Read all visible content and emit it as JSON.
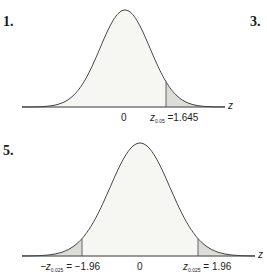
{
  "problems": [
    {
      "number": "1.",
      "x_label": "0",
      "cutoff_prefix": "z",
      "cutoff_sub": "0.05",
      "cutoff_value": "=1.645",
      "axis": "z"
    },
    {
      "number": "3."
    },
    {
      "number": "5.",
      "x_label": "0",
      "left_prefix": "−z",
      "left_sub": "0.025",
      "left_value": "= −1.96",
      "right_prefix": "z",
      "right_sub": "0.025",
      "right_value": "= 1.96",
      "axis": "z"
    }
  ],
  "chart_data": [
    {
      "type": "area",
      "title": "Standard normal curve, right tail shaded",
      "xlabel": "z",
      "shaded_region": "z > 1.645",
      "annotations": [
        "0",
        "z_0.05 = 1.645"
      ]
    },
    {
      "type": "area",
      "title": "Standard normal curve, two tails shaded",
      "xlabel": "z",
      "shaded_region": "z < -1.96 and z > 1.96",
      "annotations": [
        "-z_0.025 = -1.96",
        "0",
        "z_0.025 = 1.96"
      ]
    }
  ]
}
